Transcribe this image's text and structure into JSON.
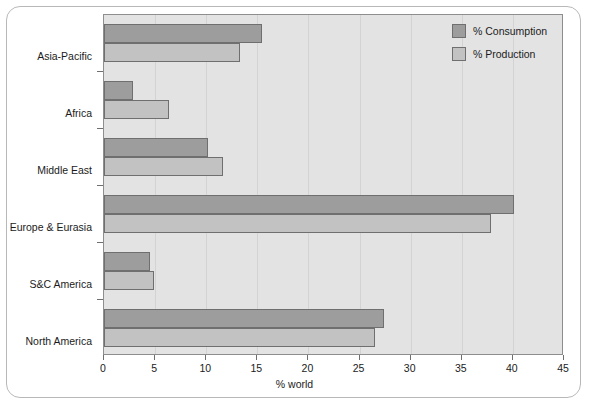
{
  "chart_data": {
    "type": "bar",
    "orientation": "horizontal",
    "title": "",
    "xlabel": "% world",
    "ylabel": "",
    "xlim": [
      0,
      45
    ],
    "xticks": [
      0,
      5,
      10,
      15,
      20,
      25,
      30,
      35,
      40,
      45
    ],
    "grid": true,
    "legend_position": "top-right",
    "categories": [
      "Asia-Pacific",
      "Africa",
      "Middle East",
      "Europe & Eurasia",
      "S&C America",
      "North America"
    ],
    "series": [
      {
        "name": "% Consumption",
        "color": "#9d9d9d",
        "values": [
          15.5,
          2.8,
          10.2,
          40.1,
          4.5,
          27.4
        ]
      },
      {
        "name": "% Production",
        "color": "#c2c2c2",
        "values": [
          13.3,
          6.4,
          11.6,
          37.9,
          4.9,
          26.5
        ]
      }
    ]
  },
  "legend": {
    "items": [
      {
        "label": "% Consumption",
        "color": "#9d9d9d"
      },
      {
        "label": "% Production",
        "color": "#c2c2c2"
      }
    ]
  },
  "axis": {
    "x_title": "% world",
    "tick_labels": [
      "0",
      "5",
      "10",
      "15",
      "20",
      "25",
      "30",
      "35",
      "40",
      "45"
    ]
  },
  "colors": {
    "plot_background": "#e3e3e3",
    "page_background": "#ffffff",
    "frame_border": "#b8b8b8",
    "axis_line": "#8e8e8e",
    "gridline": "#d3d3d3",
    "bar_outline": "#6f6f6f",
    "text": "#1b1b1b"
  }
}
